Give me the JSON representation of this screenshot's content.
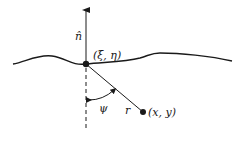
{
  "diagram": {
    "type": "geometry",
    "labels": {
      "normal": "n̂",
      "source_point": "(ξ, η)",
      "field_point": "(x, y)",
      "distance": "r",
      "angle": "ψ"
    },
    "colors": {
      "stroke": "#1a1a1a",
      "background": "#ffffff"
    }
  }
}
